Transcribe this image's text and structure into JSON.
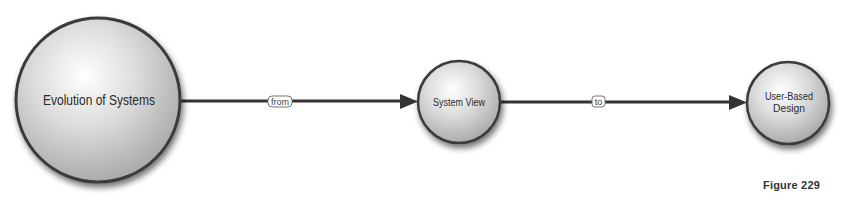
{
  "diagram": {
    "nodes": [
      {
        "id": "evolution",
        "label_lines": [
          "Evolution of Systems"
        ],
        "cx": 98,
        "cy": 100,
        "r": 82,
        "font_size": 14
      },
      {
        "id": "system-view",
        "label_lines": [
          "System View"
        ],
        "cx": 459,
        "cy": 102,
        "r": 41,
        "font_size": 10
      },
      {
        "id": "user-based-design",
        "label_lines": [
          "User-Based",
          "Design"
        ],
        "cx": 788,
        "cy": 103,
        "r": 41,
        "font_size": 10
      }
    ],
    "edges": [
      {
        "from": "evolution",
        "to": "system-view",
        "label": "from"
      },
      {
        "from": "system-view",
        "to": "user-based-design",
        "label": "to"
      }
    ],
    "colors": {
      "edge": "#333333",
      "node_stroke": "#3a3a3a",
      "node_fill_light": "#ffffff",
      "node_fill_dark": "#a8a8a8"
    }
  },
  "caption": "Figure 229"
}
